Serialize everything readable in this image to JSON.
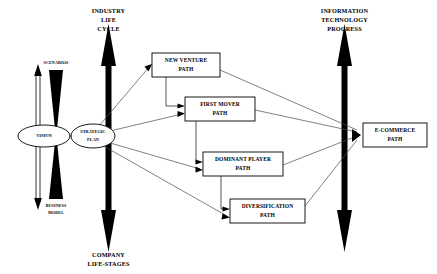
{
  "diagram": {
    "background_color": "#ffffff",
    "line_color": "#000000",
    "axes": [
      {
        "id": "industry-life-cycle",
        "top_label": "INDUSTRY\nLIFE\nCYCLE",
        "top_label_lines": [
          "INDUSTRY",
          "LIFE",
          "CYCLE"
        ],
        "bottom_label_lines": [
          "COMPANY",
          "LIFE-STAGES"
        ],
        "orientation": "vertical",
        "arrowheads": "double"
      },
      {
        "id": "information-technology-progress",
        "top_label_lines": [
          "INFORMATION",
          "TECHNOLOGY",
          "PROGRESS"
        ],
        "bottom_label_lines": [],
        "orientation": "vertical",
        "arrowheads": "double"
      }
    ],
    "bowtie": {
      "top_label": "SCENARIOS",
      "bottom_label_lines": [
        "BUSINESS",
        "MODEL"
      ],
      "side_arrow": "double-headed-vertical"
    },
    "ellipses": [
      {
        "id": "vision",
        "label_lines": [
          "VISION"
        ]
      },
      {
        "id": "strategic-plan",
        "label_lines": [
          "STRATEGIC",
          "PLAN"
        ]
      }
    ],
    "boxes": [
      {
        "id": "new-venture-path",
        "label_lines": [
          "NEW VENTURE",
          "PATH"
        ]
      },
      {
        "id": "first-mover-path",
        "label_lines": [
          "FIRST MOVER",
          "PATH"
        ]
      },
      {
        "id": "dominant-player-path",
        "label_lines": [
          "DOMINANT PLAYER",
          "PATH"
        ]
      },
      {
        "id": "diversification-path",
        "label_lines": [
          "DIVERSIFICATION",
          "PATH"
        ]
      },
      {
        "id": "e-commerce-path",
        "label_lines": [
          "E-COMMERCE",
          "PATH"
        ]
      }
    ],
    "connections": [
      {
        "from": "vision",
        "to": "strategic-plan"
      },
      {
        "from": "strategic-plan",
        "to": "new-venture-path"
      },
      {
        "from": "strategic-plan",
        "to": "first-mover-path"
      },
      {
        "from": "strategic-plan",
        "to": "dominant-player-path"
      },
      {
        "from": "strategic-plan",
        "to": "diversification-path"
      },
      {
        "from": "new-venture-path",
        "to": "first-mover-path"
      },
      {
        "from": "first-mover-path",
        "to": "dominant-player-path"
      },
      {
        "from": "dominant-player-path",
        "to": "diversification-path"
      },
      {
        "from": "new-venture-path",
        "to": "e-commerce-path"
      },
      {
        "from": "first-mover-path",
        "to": "e-commerce-path"
      },
      {
        "from": "dominant-player-path",
        "to": "e-commerce-path"
      },
      {
        "from": "diversification-path",
        "to": "e-commerce-path"
      }
    ]
  },
  "text": {
    "ilc_1": "INDUSTRY",
    "ilc_2": "LIFE",
    "ilc_3": "CYCLE",
    "cls_1": "COMPANY",
    "cls_2": "LIFE-STAGES",
    "itp_1": "INFORMATION",
    "itp_2": "TECHNOLOGY",
    "itp_3": "PROGRESS",
    "scenarios": "SCENARIOS",
    "bm_1": "BUSINESS",
    "bm_2": "MODEL",
    "vision": "VISION",
    "sp_1": "STRATEGIC",
    "sp_2": "PLAN",
    "nv_1": "NEW VENTURE",
    "nv_2": "PATH",
    "fm_1": "FIRST MOVER",
    "fm_2": "PATH",
    "dp_1": "DOMINANT PLAYER",
    "dp_2": "PATH",
    "dv_1": "DIVERSIFICATION",
    "dv_2": "PATH",
    "ec_1": "E-COMMERCE",
    "ec_2": "PATH"
  }
}
